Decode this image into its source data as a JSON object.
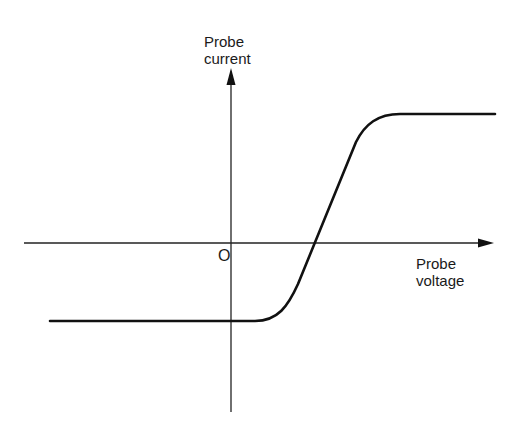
{
  "diagram": {
    "type": "probe I-V characteristic",
    "y_axis": {
      "label_line1": "Probe",
      "label_line2": "current"
    },
    "x_axis": {
      "label_line1": "Probe",
      "label_line2": "voltage"
    },
    "origin_label": "O",
    "colors": {
      "line": "#111111",
      "axis": "#222222",
      "background": "#ffffff"
    },
    "curve": {
      "description": "Step-like sigmoid: negative saturation plateau at left, steep linear rise crossing zero at positive voltage, positive saturation plateau at right",
      "lower_plateau": "negative (ion saturation current)",
      "upper_plateau": "positive (electron saturation current)"
    }
  }
}
